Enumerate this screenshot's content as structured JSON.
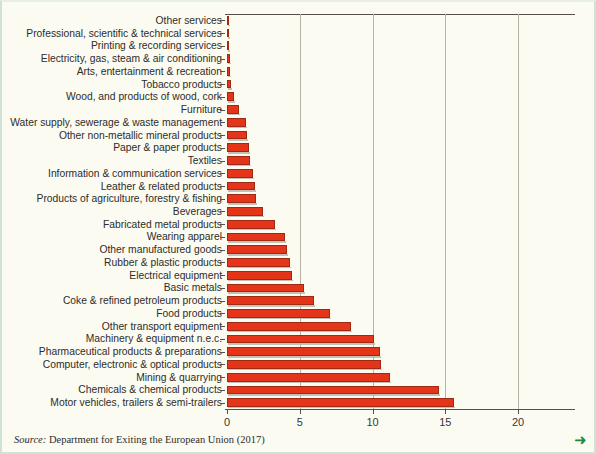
{
  "figure": {
    "background_color": "#fbfbf2",
    "border_color": "#cfe3d4",
    "bar_color": "#e4351a",
    "axis_color": "#555049",
    "grid_color": "#b7b3a8",
    "arrow_color": "#1f8a3b",
    "next_arrow_glyph": "➜"
  },
  "source": {
    "label": "Source:",
    "body": " Department for Exiting the European Union (2017)"
  },
  "chart_data": {
    "type": "bar",
    "orientation": "horizontal",
    "title": "",
    "subtitle": "",
    "xlabel": "",
    "ylabel": "",
    "xlim": [
      0,
      24
    ],
    "ticks": [
      0,
      5,
      10,
      15,
      20
    ],
    "tick_labels": [
      "0",
      "5",
      "10",
      "15",
      "20"
    ],
    "grid": true,
    "grid_axis": "x",
    "legend": false,
    "legend_position": "none",
    "categories": [
      "Other services",
      "Professional, scientific & technical services",
      "Printing & recording services",
      "Electricity, gas, steam & air conditioning",
      "Arts, entertainment & recreation",
      "Tobacco products",
      "Wood, and products of wood, cork",
      "Furniture",
      "Water supply, sewerage & waste management",
      "Other non-metallic mineral products",
      "Paper & paper products",
      "Textiles",
      "Information & communication services",
      "Leather & related products",
      "Products of agriculture, forestry & fishing",
      "Beverages",
      "Fabricated metal products",
      "Wearing apparel",
      "Other manufactured goods",
      "Rubber & plastic products",
      "Electrical equipment",
      "Basic metals",
      "Coke & refined petroleum products",
      "Food products",
      "Other transport equipment",
      "Machinery & equipment n.e.c.",
      "Pharmaceutical products & preparations",
      "Computer, electronic & optical products",
      "Mining & quarrying",
      "Chemicals & chemical products",
      "Motor vehicles, trailers & semi-trailers"
    ],
    "values": [
      0.05,
      0.1,
      0.12,
      0.2,
      0.22,
      0.25,
      0.5,
      0.8,
      1.3,
      1.4,
      1.5,
      1.6,
      1.8,
      1.9,
      2.0,
      2.5,
      3.3,
      4.0,
      4.1,
      4.3,
      4.5,
      5.3,
      6.0,
      7.1,
      8.5,
      10.1,
      10.5,
      10.6,
      11.2,
      14.6,
      15.6
    ]
  }
}
